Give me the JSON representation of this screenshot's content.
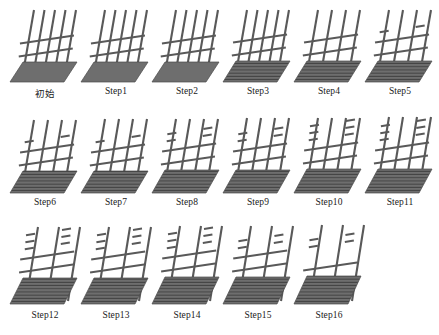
{
  "figure": {
    "type": "process-sequence-diagram",
    "panel_count": 17,
    "rows": 3,
    "columns": 6,
    "colors": {
      "bar": "#595959",
      "base_fill": "#6e6e6e",
      "base_hatch": "#3d3d3d",
      "base_stroke": "#4a4a4a",
      "background": "#ffffff",
      "caption_text": "#1a1a1a"
    }
  },
  "panels": [
    {
      "id": "panel-0",
      "label": "初始",
      "row": 0,
      "col": 0,
      "verticals": 5,
      "horizontals": 2,
      "base_style": "solid",
      "base_height": 20,
      "vertical_top": 10,
      "stub_bars": 0
    },
    {
      "id": "panel-1",
      "label": "Step1",
      "row": 0,
      "col": 1,
      "verticals": 5,
      "horizontals": 2,
      "base_style": "solid",
      "base_height": 20,
      "vertical_top": 10,
      "stub_bars": 0
    },
    {
      "id": "panel-2",
      "label": "Step2",
      "row": 0,
      "col": 2,
      "verticals": 5,
      "horizontals": 2,
      "base_style": "solid",
      "base_height": 20,
      "vertical_top": 10,
      "stub_bars": 0
    },
    {
      "id": "panel-3",
      "label": "Step3",
      "row": 0,
      "col": 3,
      "verticals": 5,
      "horizontals": 2,
      "base_style": "hatched",
      "base_height": 21,
      "vertical_top": 10,
      "stub_bars": 0
    },
    {
      "id": "panel-4",
      "label": "Step4",
      "row": 0,
      "col": 4,
      "verticals": 4,
      "horizontals": 2,
      "base_style": "hatched",
      "base_height": 21,
      "vertical_top": 10,
      "stub_bars": 0
    },
    {
      "id": "panel-5",
      "label": "Step5",
      "row": 0,
      "col": 5,
      "verticals": 4,
      "horizontals": 2,
      "base_style": "hatched",
      "base_height": 21,
      "vertical_top": 10,
      "stub_bars": 1
    },
    {
      "id": "panel-6",
      "label": "Step6",
      "row": 1,
      "col": 0,
      "verticals": 4,
      "horizontals": 2,
      "base_style": "hatched",
      "base_height": 22,
      "vertical_top": 9,
      "stub_bars": 1
    },
    {
      "id": "panel-7",
      "label": "Step7",
      "row": 1,
      "col": 1,
      "verticals": 4,
      "horizontals": 2,
      "base_style": "hatched",
      "base_height": 22,
      "vertical_top": 8,
      "stub_bars": 1
    },
    {
      "id": "panel-8",
      "label": "Step8",
      "row": 1,
      "col": 2,
      "verticals": 4,
      "horizontals": 2,
      "base_style": "hatched",
      "base_height": 23,
      "vertical_top": 8,
      "stub_bars": 2
    },
    {
      "id": "panel-9",
      "label": "Step9",
      "row": 1,
      "col": 3,
      "verticals": 4,
      "horizontals": 2,
      "base_style": "hatched",
      "base_height": 23,
      "vertical_top": 7,
      "stub_bars": 2
    },
    {
      "id": "panel-10",
      "label": "Step10",
      "row": 1,
      "col": 4,
      "verticals": 4,
      "horizontals": 2,
      "base_style": "hatched",
      "base_height": 24,
      "vertical_top": 7,
      "stub_bars": 3
    },
    {
      "id": "panel-11",
      "label": "Step11",
      "row": 1,
      "col": 5,
      "verticals": 4,
      "horizontals": 2,
      "base_style": "hatched",
      "base_height": 24,
      "vertical_top": 6,
      "stub_bars": 3
    },
    {
      "id": "panel-12",
      "label": "Step12",
      "row": 2,
      "col": 0,
      "verticals": 3,
      "horizontals": 2,
      "base_style": "hatched",
      "base_height": 26,
      "vertical_top": 5,
      "stub_bars": 4
    },
    {
      "id": "panel-13",
      "label": "Step13",
      "row": 2,
      "col": 1,
      "verticals": 3,
      "horizontals": 2,
      "base_style": "hatched",
      "base_height": 26,
      "vertical_top": 5,
      "stub_bars": 4
    },
    {
      "id": "panel-14",
      "label": "Step14",
      "row": 2,
      "col": 2,
      "verticals": 3,
      "horizontals": 2,
      "base_style": "hatched",
      "base_height": 27,
      "vertical_top": 4,
      "stub_bars": 3
    },
    {
      "id": "panel-15",
      "label": "Step15",
      "row": 2,
      "col": 3,
      "verticals": 3,
      "horizontals": 2,
      "base_style": "hatched",
      "base_height": 27,
      "vertical_top": 4,
      "stub_bars": 2
    },
    {
      "id": "panel-16",
      "label": "Step16",
      "row": 2,
      "col": 4,
      "verticals": 3,
      "horizontals": 1,
      "base_style": "hatched",
      "base_height": 28,
      "vertical_top": 3,
      "stub_bars": 2
    }
  ]
}
